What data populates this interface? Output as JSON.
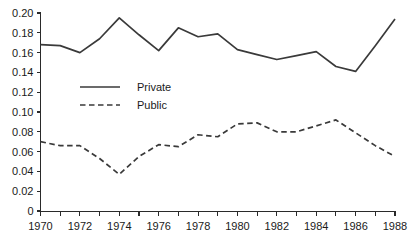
{
  "chart_data": {
    "type": "line",
    "title": "",
    "subtitle": "",
    "xlabel": "",
    "ylabel": "",
    "x": [
      1970,
      1971,
      1972,
      1973,
      1974,
      1975,
      1976,
      1977,
      1978,
      1979,
      1980,
      1981,
      1982,
      1983,
      1984,
      1985,
      1986,
      1987,
      1988
    ],
    "xlim": [
      1970,
      1988
    ],
    "ylim": [
      0,
      0.2
    ],
    "grid": false,
    "legend_position": "inside-upper-left",
    "series": [
      {
        "name": "Private",
        "style": "solid",
        "color": "#3a3a3a",
        "values": [
          0.168,
          0.167,
          0.16,
          0.174,
          0.195,
          0.178,
          0.162,
          0.185,
          0.176,
          0.179,
          0.163,
          0.158,
          0.153,
          0.157,
          0.161,
          0.146,
          0.141,
          0.167,
          0.194
        ]
      },
      {
        "name": "Public",
        "style": "dashed",
        "color": "#3a3a3a",
        "values": [
          0.07,
          0.066,
          0.066,
          0.053,
          0.037,
          0.055,
          0.067,
          0.065,
          0.077,
          0.075,
          0.088,
          0.089,
          0.08,
          0.08,
          0.086,
          0.092,
          0.079,
          0.066,
          0.055
        ]
      }
    ],
    "y_ticks": [
      {
        "value": 0,
        "label": "0"
      },
      {
        "value": 0.02,
        "label": "0.02"
      },
      {
        "value": 0.04,
        "label": "0.04"
      },
      {
        "value": 0.06,
        "label": "0.06"
      },
      {
        "value": 0.08,
        "label": "0.08"
      },
      {
        "value": 0.1,
        "label": "0.10"
      },
      {
        "value": 0.12,
        "label": "0.12"
      },
      {
        "value": 0.14,
        "label": "0.14"
      },
      {
        "value": 0.16,
        "label": "0.16"
      },
      {
        "value": 0.18,
        "label": "0.18"
      },
      {
        "value": 0.2,
        "label": "0.20"
      }
    ],
    "x_ticks": [
      {
        "value": 1970,
        "label": "1970"
      },
      {
        "value": 1971,
        "label": ""
      },
      {
        "value": 1972,
        "label": "1972"
      },
      {
        "value": 1973,
        "label": ""
      },
      {
        "value": 1974,
        "label": "1974"
      },
      {
        "value": 1975,
        "label": ""
      },
      {
        "value": 1976,
        "label": "1976"
      },
      {
        "value": 1977,
        "label": ""
      },
      {
        "value": 1978,
        "label": "1978"
      },
      {
        "value": 1979,
        "label": ""
      },
      {
        "value": 1980,
        "label": "1980"
      },
      {
        "value": 1981,
        "label": ""
      },
      {
        "value": 1982,
        "label": "1982"
      },
      {
        "value": 1983,
        "label": ""
      },
      {
        "value": 1984,
        "label": "1984"
      },
      {
        "value": 1985,
        "label": ""
      },
      {
        "value": 1986,
        "label": "1986"
      },
      {
        "value": 1987,
        "label": ""
      },
      {
        "value": 1988,
        "label": "1988"
      }
    ],
    "legend": [
      {
        "label": "Private",
        "style": "solid"
      },
      {
        "label": "Public",
        "style": "dashed"
      }
    ]
  }
}
